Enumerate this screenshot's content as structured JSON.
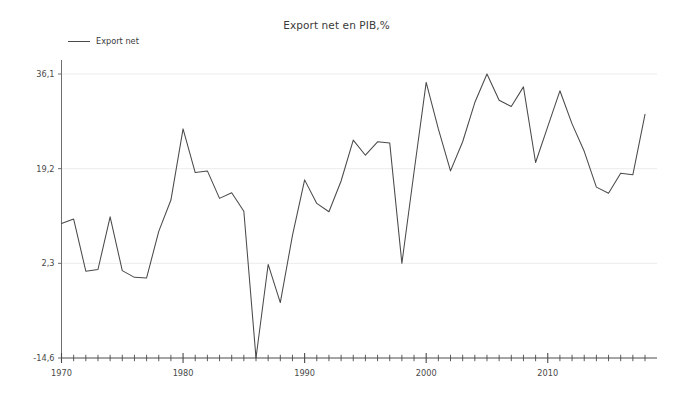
{
  "chart_data": {
    "type": "line",
    "title": "Export net en PIB,%",
    "xlabel": "",
    "ylabel": "",
    "grid": true,
    "legend_position": "top-left",
    "legend": [
      "Export net"
    ],
    "ytick_labels": [
      "36,1",
      "19,2",
      "2,3",
      "-14,6"
    ],
    "ytick_values": [
      36.1,
      19.2,
      2.3,
      -14.6
    ],
    "ylim": [
      -14.6,
      38.5
    ],
    "xtick_labels": [
      "1970",
      "1980",
      "1990",
      "2000",
      "2010"
    ],
    "xtick_values": [
      1970,
      1980,
      1990,
      2000,
      2010
    ],
    "xlim": [
      1970,
      2018
    ],
    "minor_xticks": "every year",
    "series": [
      {
        "name": "Export net",
        "color": "#4a4a4a",
        "x": [
          1970,
          1971,
          1972,
          1973,
          1974,
          1975,
          1976,
          1977,
          1978,
          1979,
          1980,
          1981,
          1982,
          1983,
          1984,
          1985,
          1986,
          1987,
          1988,
          1989,
          1990,
          1991,
          1992,
          1993,
          1994,
          1995,
          1996,
          1997,
          1998,
          1999,
          2000,
          2001,
          2002,
          2003,
          2004,
          2005,
          2006,
          2007,
          2008,
          2009,
          2010,
          2011,
          2012,
          2013,
          2014,
          2015,
          2016,
          2017,
          2018
        ],
        "y": [
          9.4,
          10.2,
          0.9,
          1.2,
          10.6,
          1.0,
          -0.2,
          -0.3,
          8.0,
          13.6,
          26.3,
          18.5,
          18.8,
          13.9,
          14.9,
          11.6,
          -14.6,
          2.1,
          -4.7,
          7.3,
          17.2,
          13.0,
          11.5,
          17.0,
          24.3,
          21.6,
          24.0,
          23.8,
          2.3,
          18.6,
          34.6,
          26.3,
          18.8,
          24.0,
          31.0,
          36.1,
          31.4,
          30.3,
          33.8,
          20.3,
          26.7,
          33.1,
          27.2,
          22.3,
          15.9,
          14.8,
          18.4,
          18.1,
          28.9
        ]
      }
    ]
  },
  "legend": {
    "label": "Export net"
  },
  "title": {
    "text": "Export net en PIB,%"
  }
}
